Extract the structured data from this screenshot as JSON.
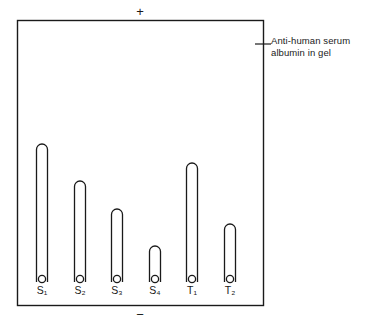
{
  "figure": {
    "name": "rocket-immunoelectrophoresis-gel",
    "anode_label": "+",
    "cathode_label": "−",
    "annotation": {
      "line1": "Anti-human serum",
      "line2": "albumin in gel"
    },
    "colors": {
      "stroke": "#1a1a1a",
      "background": "#ffffff",
      "gel_fill": "#ffffff"
    }
  },
  "chart_data": {
    "type": "bar",
    "title": "",
    "subtitle": "",
    "xlabel": "",
    "ylabel": "",
    "annotations": [
      "Anti-human serum albumin in gel",
      "+",
      "−"
    ],
    "grid": false,
    "legend": "none",
    "categories": [
      "S1",
      "S2",
      "S3",
      "S4",
      "T1",
      "T2"
    ],
    "category_labels": [
      "S₁",
      "S₂",
      "S₃",
      "S₄",
      "T₁",
      "T₂"
    ],
    "values": [
      138,
      101,
      73,
      36,
      119,
      58
    ],
    "value_units": "rocket height in px",
    "ylim": [
      0,
      262
    ],
    "series_name": "Rocket precipitin height"
  },
  "rockets": [
    {
      "id": "S1",
      "label": "S₁",
      "cx": 42,
      "top": 144,
      "base": 282
    },
    {
      "id": "S2",
      "label": "S₂",
      "cx": 80,
      "top": 181,
      "base": 282
    },
    {
      "id": "S3",
      "label": "S₃",
      "cx": 117,
      "top": 209,
      "base": 282
    },
    {
      "id": "S4",
      "label": "S₄",
      "cx": 155,
      "top": 246,
      "base": 282
    },
    {
      "id": "T1",
      "label": "T₁",
      "cx": 192,
      "top": 163,
      "base": 282
    },
    {
      "id": "T2",
      "label": "T₂",
      "cx": 230,
      "top": 224,
      "base": 282
    }
  ],
  "gel_box": {
    "x": 17,
    "y": 20,
    "width": 246,
    "height": 285
  },
  "leader_line": {
    "x1": 255,
    "y1": 44,
    "x2": 271,
    "y2": 44
  }
}
